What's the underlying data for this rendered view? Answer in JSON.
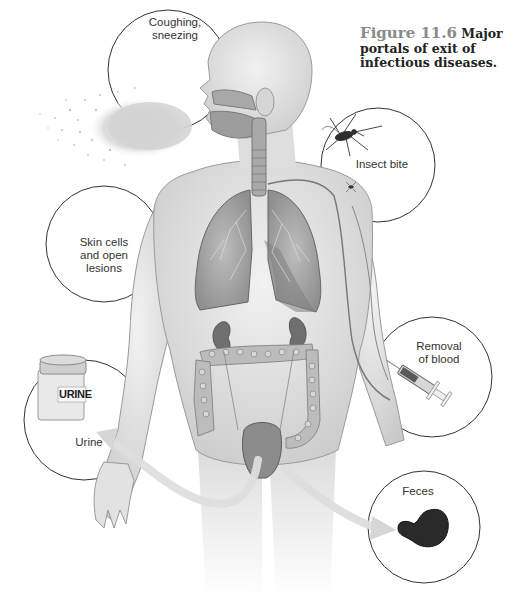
{
  "figure": {
    "number_label": "Figure 11.6",
    "title": "Major portals of exit of infectious diseases."
  },
  "callouts": [
    {
      "id": "coughing",
      "label_lines": [
        "Coughing,",
        "sneezing"
      ]
    },
    {
      "id": "insect",
      "label_lines": [
        "Insect bite"
      ]
    },
    {
      "id": "skin",
      "label_lines": [
        "Skin cells",
        "and open",
        "lesions"
      ]
    },
    {
      "id": "blood",
      "label_lines": [
        "Removal",
        "of blood"
      ]
    },
    {
      "id": "urine",
      "label_lines": [
        "Urine"
      ],
      "container_label": "URINE"
    },
    {
      "id": "feces",
      "label_lines": [
        "Feces"
      ]
    }
  ],
  "colors": {
    "circle_stroke": "#333333",
    "figure_number": "#8a8a8a",
    "skin": "#e6e6e6",
    "organ": "#8c8c8c",
    "spray": "#cfcfcf",
    "feces": "#2a2a2a"
  }
}
